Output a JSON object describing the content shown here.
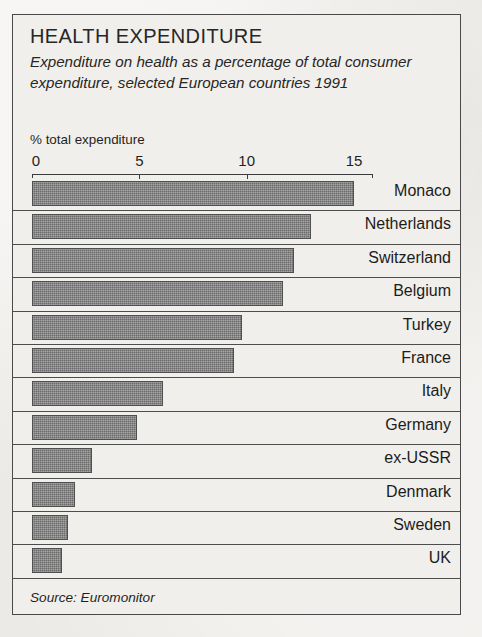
{
  "card": {
    "title": "Health Expenditure",
    "subtitle": "Expenditure on health as a percentage of total consumer expenditure, selected European countries 1991",
    "source": "Source: Euromonitor",
    "axis_caption": "% total expenditure"
  },
  "chart_data": {
    "type": "bar",
    "orientation": "horizontal",
    "title": "Health Expenditure",
    "subtitle": "Expenditure on health as a percentage of total consumer expenditure, selected European countries 1991",
    "xlabel": "% total expenditure",
    "ylabel": "",
    "xlim": [
      0,
      15.5
    ],
    "xticks": [
      0,
      5,
      10,
      15
    ],
    "xticklabels": [
      "0",
      "5",
      "10",
      "15"
    ],
    "grid": false,
    "legend": null,
    "bar_color": "#6b6b6b",
    "categories": [
      "Monaco",
      "Netherlands",
      "Switzerland",
      "Belgium",
      "Turkey",
      "France",
      "Italy",
      "Germany",
      "ex-USSR",
      "Denmark",
      "Sweden",
      "UK"
    ],
    "values": [
      15.0,
      13.0,
      12.2,
      11.7,
      9.8,
      9.4,
      6.1,
      4.9,
      2.8,
      2.0,
      1.7,
      1.4
    ],
    "units": "percent of total consumer expenditure",
    "source": "Source: Euromonitor"
  }
}
